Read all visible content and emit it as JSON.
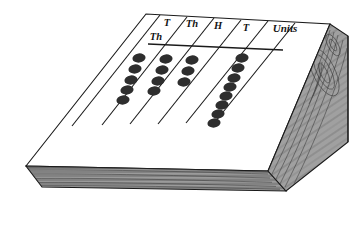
{
  "figure": {
    "name": "counting-board",
    "surface_color": "#ffffff",
    "outline_color": "#1a1a1a",
    "wood_color": "#9a9a9a",
    "wood_grain_color": "#4a4a4a",
    "counter_color": "#2e2e2e",
    "rule_color": "#1a1a1a"
  },
  "columns": [
    {
      "id": "ten-thousands",
      "label_lines": [
        "T",
        "Th"
      ],
      "label_text": "T Th",
      "counters": 5
    },
    {
      "id": "thousands",
      "label_lines": [
        "Th"
      ],
      "label_text": "Th",
      "counters": 4
    },
    {
      "id": "hundreds",
      "label_lines": [
        "H"
      ],
      "label_text": "H",
      "counters": 0
    },
    {
      "id": "tens",
      "label_lines": [
        "T"
      ],
      "label_text": "T",
      "counters": 0
    },
    {
      "id": "units",
      "label_lines": [
        "Units"
      ],
      "label_text": "Units",
      "counters": 8
    }
  ],
  "labels": {
    "ten_thousands_top": "T",
    "ten_thousands_bottom": "Th",
    "thousands": "Th",
    "hundreds": "H",
    "tens": "T",
    "units": "Units"
  }
}
